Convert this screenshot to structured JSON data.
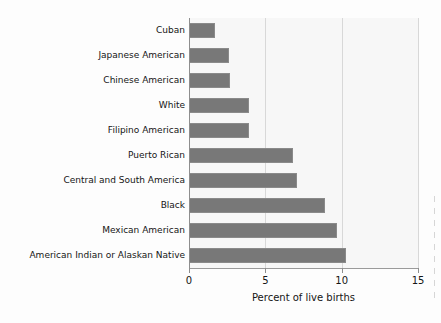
{
  "chart_data": {
    "type": "bar",
    "orientation": "horizontal",
    "title": "",
    "subtitle": "",
    "xlabel": "Percent of live births",
    "ylabel": "",
    "xlim": [
      0,
      15
    ],
    "xticks": [
      0,
      5,
      10,
      15
    ],
    "xtick_labels": [
      "0",
      "5",
      "10",
      "15"
    ],
    "grid": "vertical",
    "legend": "none",
    "bar_color": "#787878",
    "plot_background": "#f7f7f7",
    "gridline_color": "#d8d8d8",
    "axis_color": "#8e8e8e",
    "categories": [
      "Cuban",
      "Japanese American",
      "Chinese American",
      "White",
      "Filipino American",
      "Puerto Rican",
      "Central and South America",
      "Black",
      "Mexican American",
      "American Indian or Alaskan Native"
    ],
    "values": [
      1.7,
      2.6,
      2.7,
      3.9,
      3.9,
      6.8,
      7.1,
      8.9,
      9.7,
      10.3
    ],
    "series": [
      {
        "name": "Percent of live births",
        "values": [
          1.7,
          2.6,
          2.7,
          3.9,
          3.9,
          6.8,
          7.1,
          8.9,
          9.7,
          10.3
        ]
      }
    ]
  },
  "axis": {
    "value_axis_title": "Percent of live births",
    "ticks": [
      {
        "label": "0",
        "value": 0
      },
      {
        "label": "5",
        "value": 5
      },
      {
        "label": "10",
        "value": 10
      },
      {
        "label": "15",
        "value": 15
      }
    ]
  },
  "bars": [
    {
      "label": "Cuban",
      "value": 1.7
    },
    {
      "label": "Japanese American",
      "value": 2.6
    },
    {
      "label": "Chinese American",
      "value": 2.7
    },
    {
      "label": "White",
      "value": 3.9
    },
    {
      "label": "Filipino American",
      "value": 3.9
    },
    {
      "label": "Puerto Rican",
      "value": 6.8
    },
    {
      "label": "Central and South America",
      "value": 7.1
    },
    {
      "label": "Black",
      "value": 8.9
    },
    {
      "label": "Mexican American",
      "value": 9.7
    },
    {
      "label": "American Indian or Alaskan Native",
      "value": 10.3
    }
  ]
}
